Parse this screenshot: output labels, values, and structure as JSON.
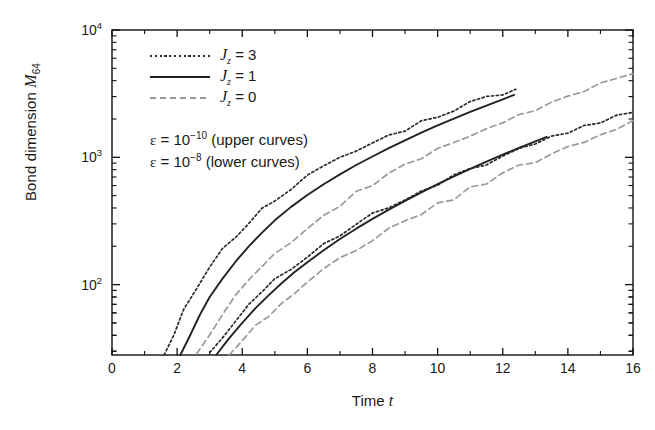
{
  "chart_data": {
    "type": "line",
    "title": "",
    "xlabel": "Time t",
    "ylabel": "Bond dimension M64",
    "xlim": [
      0,
      16
    ],
    "ylim": [
      28,
      10000
    ],
    "yscale": "log",
    "xscale": "linear",
    "grid": false,
    "legend_position": "upper-left",
    "xticks": [
      "0",
      "2",
      "4",
      "6",
      "8",
      "10",
      "12",
      "14",
      "16"
    ],
    "xtick_values": [
      0,
      2,
      4,
      6,
      8,
      10,
      12,
      14,
      16
    ],
    "yticks": [
      "10",
      "10",
      "10"
    ],
    "ytick_exponents": [
      "2",
      "3",
      "4"
    ],
    "ytick_values": [
      100,
      1000,
      10000
    ],
    "series": [
      {
        "name": "Jz=3, eps=1e-10",
        "group": "upper",
        "style": "dotted",
        "color": "#2b2b2b",
        "points": [
          [
            1.6,
            28
          ],
          [
            1.9,
            42
          ],
          [
            2.2,
            62
          ],
          [
            2.6,
            95
          ],
          [
            3.0,
            135
          ],
          [
            3.4,
            185
          ],
          [
            3.8,
            245
          ],
          [
            4.2,
            310
          ],
          [
            4.6,
            385
          ],
          [
            5.0,
            470
          ],
          [
            5.5,
            580
          ],
          [
            6.0,
            700
          ],
          [
            6.5,
            830
          ],
          [
            7.0,
            970
          ],
          [
            7.5,
            1120
          ],
          [
            8.0,
            1290
          ],
          [
            8.5,
            1470
          ],
          [
            9.0,
            1670
          ],
          [
            9.5,
            1890
          ],
          [
            10.0,
            2130
          ],
          [
            10.5,
            2390
          ],
          [
            11.0,
            2660
          ],
          [
            11.5,
            2950
          ],
          [
            12.0,
            3250
          ],
          [
            12.4,
            3520
          ]
        ]
      },
      {
        "name": "Jz=1, eps=1e-10",
        "group": "upper",
        "style": "solid",
        "color": "#222222",
        "points": [
          [
            2.1,
            28
          ],
          [
            2.4,
            40
          ],
          [
            2.7,
            58
          ],
          [
            3.0,
            80
          ],
          [
            3.4,
            112
          ],
          [
            3.8,
            152
          ],
          [
            4.2,
            200
          ],
          [
            4.6,
            255
          ],
          [
            5.0,
            320
          ],
          [
            5.5,
            408
          ],
          [
            6.0,
            505
          ],
          [
            6.5,
            615
          ],
          [
            7.0,
            735
          ],
          [
            7.5,
            870
          ],
          [
            8.0,
            1015
          ],
          [
            8.5,
            1180
          ],
          [
            9.0,
            1360
          ],
          [
            9.5,
            1560
          ],
          [
            10.0,
            1780
          ],
          [
            10.5,
            2010
          ],
          [
            11.0,
            2270
          ],
          [
            11.5,
            2550
          ],
          [
            12.0,
            2850
          ],
          [
            12.35,
            3090
          ]
        ]
      },
      {
        "name": "Jz=0, eps=1e-10",
        "group": "upper",
        "style": "dashed",
        "color": "#9a9a9a",
        "points": [
          [
            2.6,
            28
          ],
          [
            3.0,
            42
          ],
          [
            3.4,
            60
          ],
          [
            3.8,
            82
          ],
          [
            4.2,
            108
          ],
          [
            4.6,
            138
          ],
          [
            5.0,
            172
          ],
          [
            5.5,
            222
          ],
          [
            6.0,
            282
          ],
          [
            6.5,
            352
          ],
          [
            7.0,
            432
          ],
          [
            7.5,
            520
          ],
          [
            8.0,
            620
          ],
          [
            8.5,
            730
          ],
          [
            9.0,
            855
          ],
          [
            9.5,
            990
          ],
          [
            10.0,
            1140
          ],
          [
            10.5,
            1305
          ],
          [
            11.0,
            1485
          ],
          [
            11.5,
            1685
          ],
          [
            12.0,
            1900
          ],
          [
            12.5,
            2130
          ],
          [
            13.0,
            2390
          ],
          [
            13.5,
            2670
          ],
          [
            14.0,
            2970
          ],
          [
            14.5,
            3300
          ],
          [
            15.0,
            3660
          ],
          [
            15.5,
            4050
          ],
          [
            16.0,
            4480
          ]
        ]
      },
      {
        "name": "Jz=3, eps=1e-8",
        "group": "lower",
        "style": "dotted",
        "color": "#2b2b2b",
        "points": [
          [
            3.0,
            28
          ],
          [
            3.4,
            38
          ],
          [
            3.8,
            52
          ],
          [
            4.2,
            68
          ],
          [
            4.6,
            87
          ],
          [
            5.0,
            108
          ],
          [
            5.5,
            138
          ],
          [
            6.0,
            172
          ],
          [
            6.5,
            210
          ],
          [
            7.0,
            252
          ],
          [
            7.5,
            298
          ],
          [
            8.0,
            350
          ],
          [
            8.5,
            408
          ],
          [
            9.0,
            472
          ],
          [
            9.5,
            542
          ],
          [
            10.0,
            620
          ],
          [
            10.5,
            705
          ],
          [
            11.0,
            798
          ],
          [
            11.5,
            900
          ],
          [
            12.0,
            1010
          ],
          [
            12.5,
            1130
          ],
          [
            13.0,
            1260
          ],
          [
            13.5,
            1400
          ],
          [
            14.0,
            1550
          ],
          [
            14.5,
            1710
          ],
          [
            15.0,
            1880
          ],
          [
            15.5,
            2060
          ],
          [
            16.0,
            2250
          ]
        ]
      },
      {
        "name": "Jz=1, eps=1e-8",
        "group": "lower",
        "style": "solid",
        "color": "#222222",
        "points": [
          [
            3.2,
            28
          ],
          [
            3.6,
            38
          ],
          [
            4.0,
            50
          ],
          [
            4.4,
            65
          ],
          [
            4.8,
            82
          ],
          [
            5.2,
            102
          ],
          [
            5.6,
            125
          ],
          [
            6.0,
            150
          ],
          [
            6.5,
            186
          ],
          [
            7.0,
            228
          ],
          [
            7.5,
            275
          ],
          [
            8.0,
            328
          ],
          [
            8.5,
            388
          ],
          [
            9.0,
            455
          ],
          [
            9.5,
            530
          ],
          [
            10.0,
            615
          ],
          [
            10.5,
            708
          ],
          [
            11.0,
            810
          ],
          [
            11.5,
            925
          ],
          [
            12.0,
            1050
          ],
          [
            12.5,
            1185
          ],
          [
            13.0,
            1335
          ],
          [
            13.35,
            1445
          ]
        ]
      },
      {
        "name": "Jz=0, eps=1e-8",
        "group": "lower",
        "style": "dashed",
        "color": "#9a9a9a",
        "points": [
          [
            3.6,
            28
          ],
          [
            4.0,
            36
          ],
          [
            4.4,
            46
          ],
          [
            4.8,
            58
          ],
          [
            5.2,
            71
          ],
          [
            5.6,
            86
          ],
          [
            6.0,
            103
          ],
          [
            6.5,
            128
          ],
          [
            7.0,
            156
          ],
          [
            7.5,
            188
          ],
          [
            8.0,
            224
          ],
          [
            8.5,
            265
          ],
          [
            9.0,
            312
          ],
          [
            9.5,
            364
          ],
          [
            10.0,
            422
          ],
          [
            10.5,
            487
          ],
          [
            11.0,
            560
          ],
          [
            11.5,
            642
          ],
          [
            12.0,
            733
          ],
          [
            12.5,
            835
          ],
          [
            13.0,
            948
          ],
          [
            13.5,
            1072
          ],
          [
            14.0,
            1210
          ],
          [
            14.5,
            1360
          ],
          [
            15.0,
            1525
          ],
          [
            15.5,
            1705
          ],
          [
            16.0,
            1900
          ]
        ]
      }
    ],
    "annotations": [
      {
        "text": "ε = 10⁻¹⁰ (upper curves)"
      },
      {
        "text": "ε = 10⁻⁸ (lower curves)"
      }
    ]
  },
  "axes": {
    "ylabel_main": "Bond dimension ",
    "ylabel_symbol": "M",
    "ylabel_subscript": "64",
    "xlabel_main": "Time ",
    "xlabel_symbol": "t"
  },
  "legend": {
    "items": [
      {
        "symbol": "J",
        "subscript": "z",
        "equals": " = 3",
        "style": "dotted",
        "color": "#2b2b2b"
      },
      {
        "symbol": "J",
        "subscript": "z",
        "equals": " = 1",
        "style": "solid",
        "color": "#222222"
      },
      {
        "symbol": "J",
        "subscript": "z",
        "equals": " = 0",
        "style": "dashed",
        "color": "#9a9a9a"
      }
    ]
  },
  "annotations": {
    "lines": [
      {
        "eps": "ε",
        "eq": " = 10",
        "exp": "−10",
        "tail": " (upper curves)"
      },
      {
        "eps": "ε",
        "eq": " = 10",
        "exp": "−8",
        "tail": " (lower curves)"
      }
    ]
  }
}
